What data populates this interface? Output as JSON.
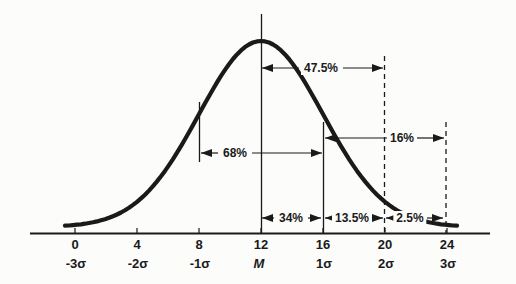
{
  "chart_data": {
    "type": "line",
    "subtype": "normal-distribution-bell-curve",
    "title": "",
    "xlabel": "",
    "ylabel": "",
    "mean_value": 12,
    "std_dev": 4,
    "axis_range": [
      0,
      24
    ],
    "grid": false,
    "x_ticks": [
      {
        "value": "0",
        "sigma": "-3σ"
      },
      {
        "value": "4",
        "sigma": "-2σ"
      },
      {
        "value": "8",
        "sigma": "-1σ"
      },
      {
        "value": "12",
        "sigma": "M"
      },
      {
        "value": "16",
        "sigma": "1σ"
      },
      {
        "value": "20",
        "sigma": "2σ"
      },
      {
        "value": "24",
        "sigma": "3σ"
      }
    ],
    "annotations": [
      {
        "label": "47.5%",
        "from_value": 12,
        "to_value": 20,
        "from": "M",
        "to": "2σ"
      },
      {
        "label": "16%",
        "from_value": 16,
        "to_value": 24,
        "from": "1σ",
        "to": "3σ"
      },
      {
        "label": "68%",
        "from_value": 8,
        "to_value": 16,
        "from": "-1σ",
        "to": "1σ"
      },
      {
        "label": "34%",
        "from_value": 12,
        "to_value": 16,
        "from": "M",
        "to": "1σ"
      },
      {
        "label": "13.5%",
        "from_value": 16,
        "to_value": 20,
        "from": "1σ",
        "to": "2σ"
      },
      {
        "label": "2.5%",
        "from_value": 20,
        "to_value": 24,
        "from": "2σ",
        "to": "3σ"
      }
    ],
    "colors": {
      "ink": "#1a1a1a",
      "paper": "#fcfcfb"
    }
  }
}
